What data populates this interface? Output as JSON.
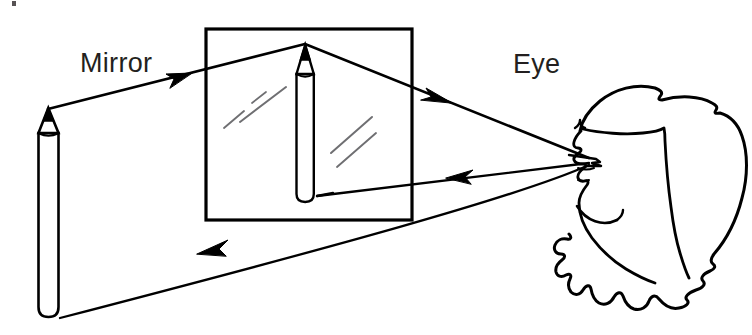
{
  "figure": {
    "title_text": null,
    "background_color": "#ffffff",
    "ink_color": "#000000",
    "glint_color": "#6f6f72",
    "width": 752,
    "height": 335,
    "type": "line-drawing-diagram"
  },
  "labels": {
    "mirror": "Mirror",
    "eye": "Eye"
  },
  "objects": {
    "mirror_frame": {
      "name": "mirror",
      "shape": "rectangle",
      "x": 205,
      "y": 28,
      "width": 207,
      "height": 192,
      "stroke_width": 3
    },
    "object_pencil": {
      "name": "pencil",
      "position": "left-foreground",
      "tip_x": 48,
      "tip_y": 108,
      "bottom_y": 316,
      "body_left": 38,
      "body_right": 59
    },
    "image_pencil": {
      "name": "reflected-pencil",
      "position": "inside-mirror",
      "tip_x": 305,
      "tip_y": 44,
      "bottom_y": 202,
      "body_left": 296,
      "body_right": 314
    },
    "head": {
      "name": "observer-head",
      "facing": "left",
      "eye_x": 588,
      "eye_y": 160
    }
  },
  "rays": [
    {
      "id": "incident-upper",
      "from": "pencil-tip",
      "to": "mirror-surface",
      "arrow_at_x": 185,
      "arrow_at_y": 77,
      "direction": "right-up"
    },
    {
      "id": "reflected-upper",
      "from": "mirror-surface",
      "to": "eye",
      "arrow_at_x": 443,
      "arrow_at_y": 97,
      "direction": "right-down"
    },
    {
      "id": "sight-line-lower",
      "from": "eye",
      "to": "mirror-surface",
      "arrow_at_x": 456,
      "arrow_at_y": 176,
      "direction": "left"
    },
    {
      "id": "virtual-image-line",
      "from": "mirror-surface",
      "to": "pencil-base",
      "arrow_at_x": 206,
      "arrow_at_y": 250,
      "direction": "left-down"
    }
  ],
  "glints": [
    {
      "id": "glint-upper-1",
      "x1": 226,
      "y1": 126,
      "x2": 264,
      "y2": 94
    },
    {
      "id": "glint-upper-2",
      "x1": 250,
      "y1": 116,
      "x2": 285,
      "y2": 88
    },
    {
      "id": "glint-lower-1",
      "x1": 333,
      "y1": 152,
      "x2": 372,
      "y2": 118
    },
    {
      "id": "glint-lower-2",
      "x1": 338,
      "y1": 165,
      "x2": 374,
      "y2": 134
    }
  ]
}
